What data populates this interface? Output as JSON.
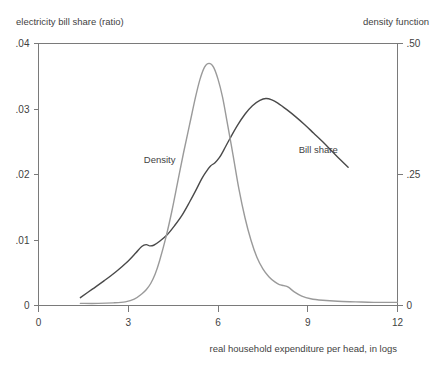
{
  "chart_data": {
    "type": "line",
    "title": "",
    "xlabel": "real household expenditure per head, in logs",
    "ylabel_left": "electricity bill share (ratio)",
    "ylabel_right": "density function",
    "xlim": [
      0,
      12
    ],
    "ylim_left": [
      0,
      0.04
    ],
    "ylim_right": [
      0,
      0.5
    ],
    "grid": false,
    "legend": "inline-annotations",
    "xticks": [
      0,
      3,
      6,
      9,
      12
    ],
    "xtick_labels": [
      "0",
      "3",
      "6",
      "9",
      "12"
    ],
    "yticks_left": [
      0,
      0.01,
      0.02,
      0.03,
      0.04
    ],
    "ytick_labels_left": [
      "0",
      ".01",
      ".02",
      ".03",
      ".04"
    ],
    "yticks_right": [
      0,
      0.25,
      0.5
    ],
    "ytick_labels_right": [
      "0",
      ".25",
      ".50"
    ],
    "series": [
      {
        "name": "Bill share",
        "axis": "left",
        "color": "#4a4a4a",
        "annotation": "Bill share",
        "annotation_x": 9.35,
        "annotation_y_left": 0.0233,
        "x": [
          1.4,
          1.8,
          2.2,
          2.6,
          3.0,
          3.25,
          3.45,
          3.6,
          3.72,
          3.85,
          4.05,
          4.3,
          4.55,
          4.8,
          5.05,
          5.25,
          5.45,
          5.6,
          5.75,
          5.9,
          6.05,
          6.2,
          6.4,
          6.65,
          6.9,
          7.15,
          7.4,
          7.6,
          7.8,
          8.0,
          8.3,
          8.6,
          8.9,
          9.2,
          9.5,
          9.8,
          10.1,
          10.35
        ],
        "y": [
          0.0012,
          0.0025,
          0.0038,
          0.0052,
          0.0068,
          0.008,
          0.009,
          0.0093,
          0.0091,
          0.0092,
          0.0098,
          0.0108,
          0.0122,
          0.0138,
          0.0158,
          0.0175,
          0.0193,
          0.0204,
          0.0213,
          0.0218,
          0.0226,
          0.0238,
          0.0255,
          0.0275,
          0.0292,
          0.0305,
          0.0313,
          0.0316,
          0.0314,
          0.0309,
          0.0299,
          0.0288,
          0.0276,
          0.0263,
          0.025,
          0.0236,
          0.0222,
          0.0211
        ]
      },
      {
        "name": "Density",
        "axis": "right",
        "color": "#9a9a9a",
        "annotation": "Density",
        "annotation_x": 4.05,
        "annotation_y_right": 0.272,
        "x": [
          1.4,
          2.0,
          2.5,
          2.9,
          3.2,
          3.45,
          3.6,
          3.75,
          3.9,
          4.05,
          4.25,
          4.45,
          4.65,
          4.85,
          5.05,
          5.25,
          5.4,
          5.55,
          5.7,
          5.85,
          6.0,
          6.15,
          6.3,
          6.5,
          6.7,
          6.9,
          7.1,
          7.3,
          7.5,
          7.7,
          7.9,
          8.05,
          8.2,
          8.35,
          8.55,
          8.8,
          9.1,
          9.5,
          10.0,
          10.6,
          11.2,
          12.0
        ],
        "y": [
          0.004,
          0.004,
          0.005,
          0.007,
          0.012,
          0.022,
          0.03,
          0.042,
          0.06,
          0.086,
          0.128,
          0.178,
          0.235,
          0.292,
          0.345,
          0.398,
          0.432,
          0.455,
          0.462,
          0.455,
          0.432,
          0.398,
          0.352,
          0.288,
          0.222,
          0.168,
          0.125,
          0.092,
          0.07,
          0.055,
          0.045,
          0.04,
          0.038,
          0.035,
          0.026,
          0.018,
          0.013,
          0.01,
          0.008,
          0.007,
          0.006,
          0.006
        ]
      }
    ]
  },
  "figure": {
    "background_color": "#ffffff",
    "frame_color": "#7a7a7a",
    "text_color": "#3f3f3f"
  }
}
